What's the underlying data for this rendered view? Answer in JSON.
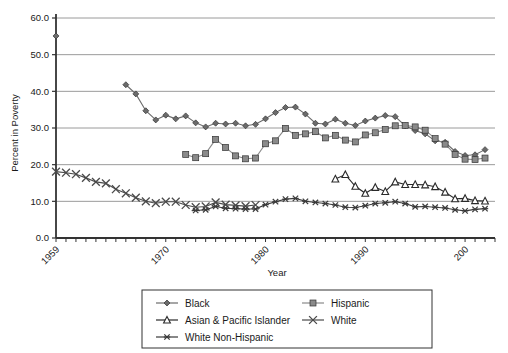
{
  "chart_data": {
    "type": "line",
    "title": "",
    "xlabel": "Year",
    "ylabel": "Percent in Poverty",
    "xlim": [
      1959,
      2003
    ],
    "ylim": [
      0,
      60
    ],
    "yticks": [
      "0.0",
      "10.0",
      "20.0",
      "30.0",
      "40.0",
      "50.0",
      "60.0"
    ],
    "xticks": [
      "1959",
      "1970",
      "1980",
      "1990",
      "200"
    ],
    "xtick_values": [
      1959,
      1970,
      1980,
      1990,
      2000
    ],
    "grid": "horizontal",
    "legend_position": "bottom",
    "series": [
      {
        "name": "Black",
        "marker": "diamond",
        "color": "#6b6b6b",
        "points": [
          [
            1959,
            55.1
          ],
          [
            1966,
            41.8
          ],
          [
            1967,
            39.3
          ],
          [
            1968,
            34.7
          ],
          [
            1969,
            32.2
          ],
          [
            1970,
            33.5
          ],
          [
            1971,
            32.5
          ],
          [
            1972,
            33.3
          ],
          [
            1973,
            31.4
          ],
          [
            1974,
            30.3
          ],
          [
            1975,
            31.3
          ],
          [
            1976,
            31.1
          ],
          [
            1977,
            31.3
          ],
          [
            1978,
            30.6
          ],
          [
            1979,
            31.0
          ],
          [
            1980,
            32.5
          ],
          [
            1981,
            34.2
          ],
          [
            1982,
            35.6
          ],
          [
            1983,
            35.7
          ],
          [
            1984,
            33.8
          ],
          [
            1985,
            31.3
          ],
          [
            1986,
            31.1
          ],
          [
            1987,
            32.4
          ],
          [
            1988,
            31.3
          ],
          [
            1989,
            30.7
          ],
          [
            1990,
            31.9
          ],
          [
            1991,
            32.7
          ],
          [
            1992,
            33.4
          ],
          [
            1993,
            33.1
          ],
          [
            1994,
            30.6
          ],
          [
            1995,
            29.3
          ],
          [
            1996,
            28.4
          ],
          [
            1997,
            26.5
          ],
          [
            1998,
            26.1
          ],
          [
            1999,
            23.6
          ],
          [
            2000,
            22.5
          ],
          [
            2001,
            22.7
          ],
          [
            2002,
            24.1
          ]
        ]
      },
      {
        "name": "Hispanic",
        "marker": "square",
        "color": "#8a8a8a",
        "points": [
          [
            1972,
            22.8
          ],
          [
            1973,
            21.9
          ],
          [
            1974,
            23.0
          ],
          [
            1975,
            26.9
          ],
          [
            1976,
            24.7
          ],
          [
            1977,
            22.4
          ],
          [
            1978,
            21.6
          ],
          [
            1979,
            21.8
          ],
          [
            1980,
            25.7
          ],
          [
            1981,
            26.5
          ],
          [
            1982,
            29.9
          ],
          [
            1983,
            28.0
          ],
          [
            1984,
            28.4
          ],
          [
            1985,
            29.0
          ],
          [
            1986,
            27.3
          ],
          [
            1987,
            28.0
          ],
          [
            1988,
            26.7
          ],
          [
            1989,
            26.2
          ],
          [
            1990,
            28.1
          ],
          [
            1991,
            28.7
          ],
          [
            1992,
            29.6
          ],
          [
            1993,
            30.6
          ],
          [
            1994,
            30.7
          ],
          [
            1995,
            30.3
          ],
          [
            1996,
            29.4
          ],
          [
            1997,
            27.1
          ],
          [
            1998,
            25.6
          ],
          [
            1999,
            22.8
          ],
          [
            2000,
            21.5
          ],
          [
            2001,
            21.4
          ],
          [
            2002,
            21.8
          ]
        ]
      },
      {
        "name": "Asian & Pacific Islander",
        "marker": "triangle",
        "color": "#2a2a2a",
        "points": [
          [
            1987,
            16.1
          ],
          [
            1988,
            17.3
          ],
          [
            1989,
            14.1
          ],
          [
            1990,
            12.2
          ],
          [
            1991,
            13.8
          ],
          [
            1992,
            12.7
          ],
          [
            1993,
            15.3
          ],
          [
            1994,
            14.6
          ],
          [
            1995,
            14.6
          ],
          [
            1996,
            14.5
          ],
          [
            1997,
            14.0
          ],
          [
            1998,
            12.5
          ],
          [
            1999,
            10.7
          ],
          [
            2000,
            10.8
          ],
          [
            2001,
            10.2
          ],
          [
            2002,
            10.1
          ]
        ]
      },
      {
        "name": "White",
        "marker": "x",
        "color": "#4a4a4a",
        "points": [
          [
            1959,
            18.1
          ],
          [
            1960,
            17.8
          ],
          [
            1961,
            17.4
          ],
          [
            1962,
            16.4
          ],
          [
            1963,
            15.3
          ],
          [
            1964,
            14.9
          ],
          [
            1965,
            13.3
          ],
          [
            1966,
            12.2
          ],
          [
            1967,
            11.0
          ],
          [
            1968,
            10.0
          ],
          [
            1969,
            9.5
          ],
          [
            1970,
            9.9
          ],
          [
            1971,
            9.9
          ],
          [
            1972,
            9.0
          ],
          [
            1973,
            8.4
          ],
          [
            1974,
            8.6
          ],
          [
            1975,
            9.7
          ],
          [
            1976,
            9.1
          ],
          [
            1977,
            8.9
          ],
          [
            1978,
            8.7
          ],
          [
            1979,
            9.0
          ]
        ]
      },
      {
        "name": "White Non-Hispanic",
        "marker": "asterisk",
        "color": "#3a3a3a",
        "points": [
          [
            1973,
            7.5
          ],
          [
            1974,
            7.7
          ],
          [
            1975,
            8.6
          ],
          [
            1976,
            8.1
          ],
          [
            1977,
            8.0
          ],
          [
            1978,
            7.9
          ],
          [
            1979,
            7.9
          ],
          [
            1980,
            9.1
          ],
          [
            1981,
            9.9
          ],
          [
            1982,
            10.6
          ],
          [
            1983,
            10.8
          ],
          [
            1984,
            10.0
          ],
          [
            1985,
            9.7
          ],
          [
            1986,
            9.4
          ],
          [
            1987,
            9.0
          ],
          [
            1988,
            8.4
          ],
          [
            1989,
            8.3
          ],
          [
            1990,
            8.8
          ],
          [
            1991,
            9.4
          ],
          [
            1992,
            9.6
          ],
          [
            1993,
            9.9
          ],
          [
            1994,
            9.4
          ],
          [
            1995,
            8.5
          ],
          [
            1996,
            8.6
          ],
          [
            1997,
            8.4
          ],
          [
            1998,
            8.2
          ],
          [
            1999,
            7.7
          ],
          [
            2000,
            7.4
          ],
          [
            2001,
            7.8
          ],
          [
            2002,
            8.0
          ]
        ]
      }
    ]
  },
  "axis": {
    "ylabel": "Percent in Poverty",
    "xlabel": "Year",
    "yticks": [
      {
        "label": "60.0",
        "value": 60
      },
      {
        "label": "50.0",
        "value": 50
      },
      {
        "label": "40.0",
        "value": 40
      },
      {
        "label": "30.0",
        "value": 30
      },
      {
        "label": "20.0",
        "value": 20
      },
      {
        "label": "10.0",
        "value": 10
      },
      {
        "label": "0.0",
        "value": 0
      }
    ],
    "xticks": [
      {
        "label": "1959",
        "value": 1959
      },
      {
        "label": "1970",
        "value": 1970
      },
      {
        "label": "1980",
        "value": 1980
      },
      {
        "label": "1990",
        "value": 1990
      },
      {
        "label": "200",
        "value": 2000
      }
    ]
  },
  "legend": {
    "entries": [
      {
        "label": "Black",
        "marker": "diamond",
        "color": "#6b6b6b"
      },
      {
        "label": "Hispanic",
        "marker": "square",
        "color": "#8a8a8a"
      },
      {
        "label": "Asian & Pacific Islander",
        "marker": "triangle",
        "color": "#2a2a2a"
      },
      {
        "label": "White",
        "marker": "x",
        "color": "#4a4a4a"
      },
      {
        "label": "White Non-Hispanic",
        "marker": "asterisk",
        "color": "#3a3a3a"
      }
    ]
  },
  "style": {
    "grid_color": "#808080",
    "axis_color": "#333333",
    "background": "#ffffff"
  }
}
